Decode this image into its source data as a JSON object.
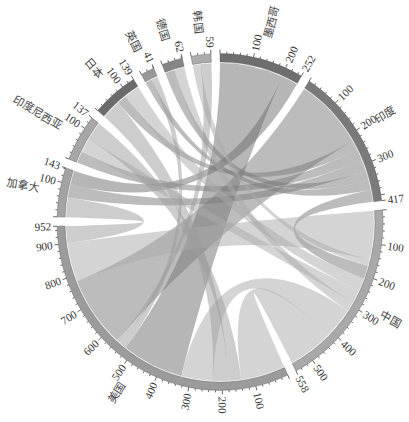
{
  "chart_data": {
    "type": "chord",
    "title": "",
    "start_deg": 0,
    "gap_deg": 3.2,
    "tick_major": 100,
    "tick_minor": 20,
    "link_opacity": 0.5,
    "sectors": [
      {
        "name": "墨西哥",
        "total": 252,
        "color": "#6e6e6e",
        "ticks": [
          100,
          200,
          252
        ]
      },
      {
        "name": "印度",
        "total": 417,
        "color": "#7a7a7a",
        "ticks": [
          100,
          200,
          300,
          417
        ]
      },
      {
        "name": "中国",
        "total": 558,
        "color": "#a9a9a9",
        "ticks": [
          100,
          200,
          300,
          400,
          500,
          558
        ]
      },
      {
        "name": "美国",
        "total": 952,
        "color": "#9b9b9b",
        "ticks": [
          100,
          200,
          300,
          400,
          500,
          600,
          700,
          800,
          900,
          952
        ]
      },
      {
        "name": "加拿大",
        "total": 143,
        "color": "#a3a3a3",
        "ticks": [
          100,
          143
        ]
      },
      {
        "name": "印度尼西亚",
        "total": 137,
        "color": "#a6a6a6",
        "ticks": [
          100,
          137
        ]
      },
      {
        "name": "日本",
        "total": 139,
        "color": "#6a6a6a",
        "ticks": [
          100,
          139
        ]
      },
      {
        "name": "英国",
        "total": 41,
        "color": "#999999",
        "ticks": [
          41
        ]
      },
      {
        "name": "德国",
        "total": 62,
        "color": "#858585",
        "ticks": [
          62
        ]
      },
      {
        "name": "韩国",
        "total": 59,
        "color": "#acacac",
        "ticks": [
          59
        ]
      }
    ],
    "links": [
      {
        "from": "墨西哥",
        "from_range": [
          0,
          200
        ],
        "to": "美国",
        "to_range": [
          330,
          525
        ]
      },
      {
        "from": "墨西哥",
        "from_range": [
          200,
          252
        ],
        "to": "加拿大",
        "to_range": [
          100,
          143
        ]
      },
      {
        "from": "印度",
        "from_range": [
          0,
          220
        ],
        "to": "美国",
        "to_range": [
          560,
          780
        ]
      },
      {
        "from": "印度",
        "from_range": [
          220,
          250
        ],
        "to": "日本",
        "to_range": [
          60,
          90
        ]
      },
      {
        "from": "印度",
        "from_range": [
          250,
          285
        ],
        "to": "印度尼西亚",
        "to_range": [
          0,
          35
        ]
      },
      {
        "from": "印度",
        "from_range": [
          285,
          320
        ],
        "to": "加拿大",
        "to_range": [
          60,
          100
        ]
      },
      {
        "from": "印度",
        "from_range": [
          320,
          350
        ],
        "to": "德国",
        "to_range": [
          0,
          30
        ]
      },
      {
        "from": "印度",
        "from_range": [
          350,
          380
        ],
        "to": "英国",
        "to_range": [
          0,
          20
        ]
      },
      {
        "from": "印度",
        "from_range": [
          380,
          417
        ],
        "to": "中国",
        "to_range": [
          170,
          210
        ]
      },
      {
        "from": "中国",
        "from_range": [
          0,
          150
        ],
        "to": "美国",
        "to_range": [
          780,
          900
        ]
      },
      {
        "from": "中国",
        "from_range": [
          150,
          170
        ],
        "to": "韩国",
        "to_range": [
          0,
          25
        ]
      },
      {
        "from": "中国",
        "from_range": [
          210,
          250
        ],
        "to": "日本",
        "to_range": [
          90,
          139
        ]
      },
      {
        "from": "中国",
        "from_range": [
          250,
          290
        ],
        "to": "印度尼西亚",
        "to_range": [
          35,
          80
        ]
      },
      {
        "from": "中国",
        "from_range": [
          290,
          320
        ],
        "to": "德国",
        "to_range": [
          30,
          62
        ]
      },
      {
        "from": "中国",
        "from_range": [
          320,
          420
        ],
        "to": "美国",
        "to_range": [
          230,
          330
        ]
      },
      {
        "from": "中国",
        "from_range": [
          420,
          558
        ],
        "to": "美国",
        "to_range": [
          0,
          140
        ]
      },
      {
        "from": "美国",
        "from_range": [
          140,
          180
        ],
        "to": "印度尼西亚",
        "to_range": [
          80,
          137
        ]
      },
      {
        "from": "美国",
        "from_range": [
          180,
          230
        ],
        "to": "日本",
        "to_range": [
          0,
          60
        ]
      },
      {
        "from": "美国",
        "from_range": [
          525,
          545
        ],
        "to": "英国",
        "to_range": [
          20,
          41
        ]
      },
      {
        "from": "美国",
        "from_range": [
          545,
          560
        ],
        "to": "韩国",
        "to_range": [
          25,
          59
        ]
      },
      {
        "from": "美国",
        "from_range": [
          900,
          952
        ],
        "to": "加拿大",
        "to_range": [
          0,
          60
        ]
      }
    ]
  }
}
